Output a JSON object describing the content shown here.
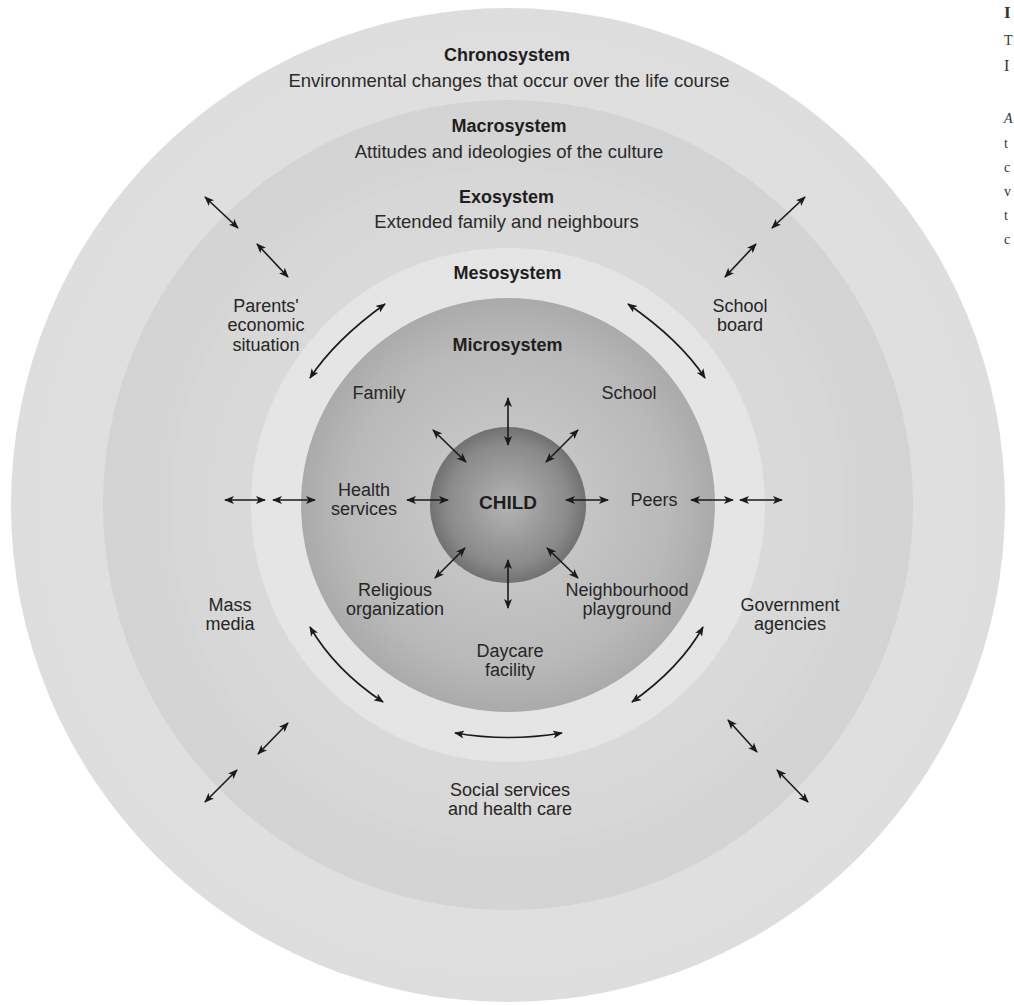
{
  "diagram": {
    "center": {
      "x": 508,
      "y": 505
    },
    "rings": [
      {
        "name": "Chronosystem",
        "radius": 497,
        "color_outer": "#9a9a9a",
        "color_inner": "#e4e4e4"
      },
      {
        "name": "Macrosystem",
        "radius": 405,
        "color_outer": "#8e8e8e",
        "color_inner": "#d6d6d6"
      },
      {
        "name": "Exosystem",
        "radius": 337,
        "color_outer": "#a4a4a4",
        "color_inner": "#dadada"
      },
      {
        "name": "Mesosystem",
        "radius": 257,
        "color_outer": "#8a8a8a",
        "color_inner": "#dedede"
      },
      {
        "name": "Microsystem",
        "radius": 207,
        "color_outer": "#6e6e6e",
        "color_inner": "#b8b8b8"
      },
      {
        "name": "Child",
        "radius": 78,
        "color_outer": "#4a4a4a",
        "color_inner": "#a8a8a8"
      }
    ],
    "systems": {
      "chronosystem": {
        "title": "Chronosystem",
        "description": "Environmental changes that occur over the life course"
      },
      "macrosystem": {
        "title": "Macrosystem",
        "description": "Attitudes and ideologies of the culture"
      },
      "exosystem": {
        "title": "Exosystem",
        "description": "Extended family and neighbours"
      },
      "mesosystem": {
        "title": "Mesosystem"
      },
      "microsystem": {
        "title": "Microsystem"
      },
      "child": {
        "title": "CHILD"
      }
    },
    "exosystem_items": {
      "parents_economic": [
        "Parents'",
        "economic",
        "situation"
      ],
      "school_board": [
        "School",
        "board"
      ],
      "mass_media": [
        "Mass",
        "media"
      ],
      "government": [
        "Government",
        "agencies"
      ],
      "social_services": [
        "Social services",
        "and health care"
      ]
    },
    "microsystem_items": {
      "family": "Family",
      "school": "School",
      "health": [
        "Health",
        "services"
      ],
      "peers": "Peers",
      "religious": [
        "Religious",
        "organization"
      ],
      "neighbourhood": [
        "Neighbourhood",
        "playground"
      ],
      "daycare": [
        "Daycare",
        "facility"
      ]
    }
  },
  "side_caption_fragments": [
    "I",
    "T",
    "I",
    "A",
    "t",
    "c",
    "v",
    "t",
    "c"
  ]
}
